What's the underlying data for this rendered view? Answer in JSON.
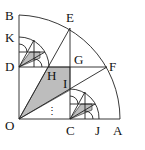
{
  "figure": {
    "type": "geometry",
    "points": {
      "O": [
        19,
        119
      ],
      "A": [
        120,
        119
      ],
      "B": [
        19,
        15
      ],
      "C": [
        70,
        119
      ],
      "D": [
        19,
        67
      ],
      "E": [
        70,
        28
      ],
      "F": [
        107,
        67
      ],
      "G": [
        70,
        67
      ],
      "H": [
        48,
        67
      ],
      "I": [
        70,
        90
      ],
      "K": [
        19,
        37
      ],
      "J": [
        98,
        119
      ]
    },
    "labels": [
      {
        "text": "B",
        "x": 5,
        "y": 20
      },
      {
        "text": "E",
        "x": 66,
        "y": 22
      },
      {
        "text": "K",
        "x": 5,
        "y": 42
      },
      {
        "text": "D",
        "x": 5,
        "y": 71
      },
      {
        "text": "G",
        "x": 74,
        "y": 64
      },
      {
        "text": "F",
        "x": 109,
        "y": 71
      },
      {
        "text": "H",
        "x": 47,
        "y": 80
      },
      {
        "text": "I",
        "x": 63,
        "y": 88
      },
      {
        "text": "O",
        "x": 5,
        "y": 130
      },
      {
        "text": "C",
        "x": 66,
        "y": 135
      },
      {
        "text": "J",
        "x": 95,
        "y": 135
      },
      {
        "text": "A",
        "x": 113,
        "y": 135
      }
    ],
    "ellipsis": "⋮",
    "shade_color": "#bdbdbd",
    "line_color": "#222222"
  }
}
